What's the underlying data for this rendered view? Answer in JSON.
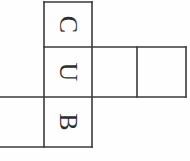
{
  "figure": {
    "type": "cube-net-diagram",
    "background_color": "#fefefe",
    "line_color": "#3a3a3a",
    "letter_color": "#2e2e2e",
    "line_width": 1.6,
    "canvas": {
      "width": 190,
      "height": 161
    },
    "letter_rotation_degrees": 90,
    "letters_sequence": "CUB"
  },
  "cells": [
    {
      "id": "cell-top-center",
      "label": "C",
      "has_label": true,
      "rotation": 90,
      "x": 44,
      "y": 2,
      "w": 48,
      "h": 45,
      "clipped": false,
      "font_size": 26
    },
    {
      "id": "cell-middle-center",
      "label": "U",
      "has_label": true,
      "rotation": 90,
      "x": 44,
      "y": 47,
      "w": 48,
      "h": 50,
      "clipped": false,
      "font_size": 26
    },
    {
      "id": "cell-bottom-center",
      "label": "B",
      "has_label": true,
      "rotation": 90,
      "x": 44,
      "y": 97,
      "w": 48,
      "h": 50,
      "clipped": false,
      "font_size": 26
    },
    {
      "id": "cell-middle-right-inner",
      "label": "",
      "has_label": false,
      "rotation": 0,
      "x": 92,
      "y": 47,
      "w": 45,
      "h": 50,
      "clipped": false,
      "font_size": 26
    },
    {
      "id": "cell-middle-right-outer",
      "label": "",
      "has_label": false,
      "rotation": 0,
      "x": 137,
      "y": 47,
      "w": 49,
      "h": 50,
      "clipped": false,
      "font_size": 26
    },
    {
      "id": "cell-bottom-left",
      "label": "",
      "has_label": false,
      "rotation": 0,
      "x": -6,
      "y": 97,
      "w": 50,
      "h": 50,
      "clipped": true,
      "font_size": 26
    }
  ],
  "segments": [
    {
      "id": "seg-top-edge",
      "x1": 44,
      "y1": 2,
      "x2": 92,
      "y2": 2
    },
    {
      "id": "seg-row1-row2-divider",
      "x1": 44,
      "y1": 47,
      "x2": 186,
      "y2": 47
    },
    {
      "id": "seg-row2-row3-divider",
      "x1": 0,
      "y1": 97,
      "x2": 186,
      "y2": 97
    },
    {
      "id": "seg-bottom-edge",
      "x1": 0,
      "y1": 147,
      "x2": 92,
      "y2": 147
    },
    {
      "id": "seg-left-center-column",
      "x1": 44,
      "y1": 2,
      "x2": 44,
      "y2": 147
    },
    {
      "id": "seg-right-center-column",
      "x1": 92,
      "y1": 2,
      "x2": 92,
      "y2": 147
    },
    {
      "id": "seg-right-arm-divider",
      "x1": 137,
      "y1": 47,
      "x2": 137,
      "y2": 97
    },
    {
      "id": "seg-right-arm-edge",
      "x1": 186,
      "y1": 47,
      "x2": 186,
      "y2": 97
    }
  ]
}
